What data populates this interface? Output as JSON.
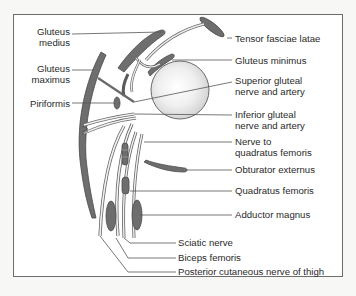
{
  "diagram": {
    "colors": {
      "muscle_fill": "#6e6e6e",
      "muscle_stroke": "#4a4a4a",
      "nerve_fill": "#e8e8e8",
      "leader_line": "#555555",
      "frame": "#6d6d6d",
      "background": "#ffffff"
    },
    "labels_left": [
      {
        "id": "gluteus-medius",
        "line1": "Gluteus",
        "line2": "medius"
      },
      {
        "id": "gluteus-maximus",
        "line1": "Gluteus",
        "line2": "maximus"
      },
      {
        "id": "piriformis",
        "line1": "Piriformis",
        "line2": ""
      }
    ],
    "labels_right": [
      {
        "id": "tensor-fasciae-latae",
        "line1": "Tensor fasciae latae",
        "line2": ""
      },
      {
        "id": "gluteus-minimus",
        "line1": "Gluteus minimus",
        "line2": ""
      },
      {
        "id": "superior-gluteal",
        "line1": "Superior gluteal",
        "line2": "nerve and artery"
      },
      {
        "id": "inferior-gluteal",
        "line1": "Inferior gluteal",
        "line2": "nerve and artery"
      },
      {
        "id": "nerve-to-quadratus",
        "line1": "Nerve to",
        "line2": "quadratus femoris"
      },
      {
        "id": "obturator-externus",
        "line1": "Obturator externus",
        "line2": ""
      },
      {
        "id": "quadratus-femoris",
        "line1": "Quadratus femoris",
        "line2": ""
      },
      {
        "id": "adductor-magnus",
        "line1": "Adductor magnus",
        "line2": ""
      }
    ],
    "labels_bottom": [
      {
        "id": "sciatic-nerve",
        "line1": "Sciatic nerve"
      },
      {
        "id": "biceps-femoris",
        "line1": "Biceps femoris"
      },
      {
        "id": "posterior-cutaneous",
        "line1": "Posterior cutaneous nerve of thigh"
      }
    ]
  }
}
